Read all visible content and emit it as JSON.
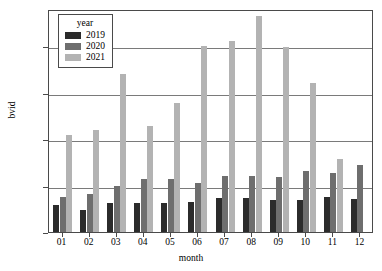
{
  "chart_data": {
    "type": "bar",
    "title": "",
    "xlabel": "month",
    "ylabel": "bvid",
    "categories": [
      "01",
      "02",
      "03",
      "04",
      "05",
      "06",
      "07",
      "08",
      "09",
      "10",
      "11",
      "12"
    ],
    "ytick_labels": [
      "0",
      "5 000",
      "10 000",
      "15 000",
      "20 000"
    ],
    "ytick_values": [
      0,
      5000,
      10000,
      15000,
      20000
    ],
    "ylim": [
      0,
      24000
    ],
    "grid": true,
    "legend_position": "top-left",
    "legend_title": "year",
    "series": [
      {
        "name": "2019",
        "color": "#2b2b2b",
        "values": [
          2900,
          2400,
          3150,
          3150,
          3150,
          3250,
          3700,
          3700,
          3400,
          3450,
          3750,
          3500
        ]
      },
      {
        "name": "2020",
        "color": "#6e6e6e",
        "values": [
          3750,
          4100,
          4900,
          5700,
          5750,
          5250,
          6050,
          6050,
          5950,
          6550,
          6300,
          7200
        ]
      },
      {
        "name": "2021",
        "color": "#b3b3b3",
        "values": [
          10400,
          10950,
          17050,
          11450,
          13850,
          20000,
          20550,
          23250,
          19900,
          16000,
          7900,
          null
        ]
      }
    ]
  }
}
